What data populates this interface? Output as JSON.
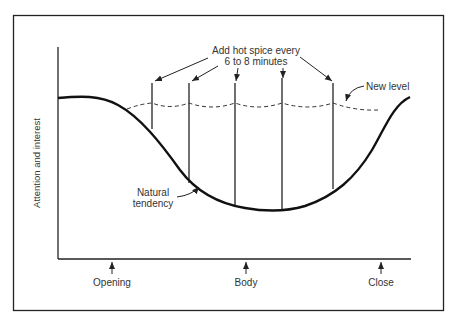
{
  "diagram": {
    "y_axis_label": "Attention and interest",
    "x_axis_markers": [
      {
        "label": "Opening",
        "x": 112
      },
      {
        "label": "Body",
        "x": 246
      },
      {
        "label": "Close",
        "x": 381
      }
    ],
    "annotations": {
      "spice_line1": "Add hot spice every",
      "spice_line2": "6 to 8 minutes",
      "new_level": "New level",
      "natural_line1": "Natural",
      "natural_line2": "tendency"
    },
    "curves": {
      "natural_tendency": "solid thick U-shaped curve: high at opening, dips through body, rises at close",
      "new_level": "dashed scalloped line held near opening level by periodic spikes"
    },
    "spice_spikes_count": 5,
    "colors": {
      "line": "#222222",
      "text": "#333333",
      "background": "#ffffff"
    }
  }
}
